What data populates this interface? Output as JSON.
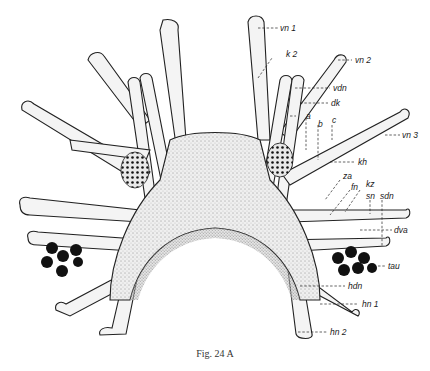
{
  "figure": {
    "caption": "Fig. 24 A",
    "ink_color": "#1a1a1a",
    "background_color": "#ffffff"
  },
  "labels": [
    {
      "id": "vn1",
      "text": "vn 1"
    },
    {
      "id": "k2",
      "text": "k 2"
    },
    {
      "id": "vn2",
      "text": "vn 2"
    },
    {
      "id": "vdn",
      "text": "vdn"
    },
    {
      "id": "dk",
      "text": "dk"
    },
    {
      "id": "a",
      "text": "a"
    },
    {
      "id": "b",
      "text": "b"
    },
    {
      "id": "c",
      "text": "c"
    },
    {
      "id": "vn3",
      "text": "vn 3"
    },
    {
      "id": "kh",
      "text": "kh"
    },
    {
      "id": "za",
      "text": "za"
    },
    {
      "id": "fn",
      "text": "fn"
    },
    {
      "id": "kz",
      "text": "kz"
    },
    {
      "id": "sn",
      "text": "sn"
    },
    {
      "id": "sdn",
      "text": "sdn"
    },
    {
      "id": "dva",
      "text": "dva"
    },
    {
      "id": "tau",
      "text": "tau"
    },
    {
      "id": "hdn",
      "text": "hdn"
    },
    {
      "id": "hn1",
      "text": "hn 1"
    },
    {
      "id": "hn2",
      "text": "hn 2"
    }
  ]
}
